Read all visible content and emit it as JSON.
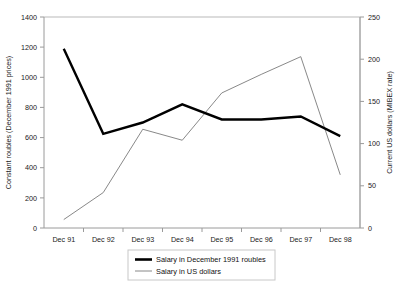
{
  "chart_data": {
    "type": "line",
    "title": "",
    "xlabel": "",
    "ylabel": "Constant roubles (December 1991 prices)",
    "y2label": "Current US dollars (MIBEX rate)",
    "categories": [
      "Dec 91",
      "Dec 92",
      "Dec 93",
      "Dec 94",
      "Dec 95",
      "Dec 96",
      "Dec 97",
      "Dec 98"
    ],
    "ylim": [
      0,
      1400
    ],
    "y2lim": [
      0,
      250
    ],
    "yticks": [
      0,
      200,
      400,
      600,
      800,
      1000,
      1200,
      1400
    ],
    "y2ticks": [
      0,
      50,
      100,
      150,
      200,
      250
    ],
    "grid": false,
    "legend_position": "bottom",
    "series": [
      {
        "name": "Salary in December 1991 roubles",
        "axis": "left",
        "color": "#000000",
        "style": "thick",
        "values": [
          1190,
          625,
          700,
          820,
          720,
          720,
          740,
          610
        ]
      },
      {
        "name": "Salary in US dollars",
        "axis": "right",
        "color": "#7a7a7a",
        "style": "thin",
        "values": [
          10,
          42,
          117,
          104,
          160,
          182,
          203,
          63
        ]
      }
    ]
  },
  "axes": {
    "left": {
      "title": "Constant roubles (December 1991 prices)",
      "tick_labels": [
        "0",
        "200",
        "400",
        "600",
        "800",
        "1000",
        "1200",
        "1400"
      ]
    },
    "right": {
      "title": "Current US dollars (MIBEX rate)",
      "tick_labels": [
        "0",
        "50",
        "100",
        "150",
        "200",
        "250"
      ]
    },
    "bottom": {
      "tick_labels": [
        "Dec 91",
        "Dec 92",
        "Dec 93",
        "Dec 94",
        "Dec 95",
        "Dec 96",
        "Dec 97",
        "Dec 98"
      ]
    }
  },
  "legend": {
    "items": [
      {
        "label": "Salary in December 1991 roubles",
        "style": "thick"
      },
      {
        "label": "Salary in US dollars",
        "style": "thin"
      }
    ]
  },
  "colors": {
    "series_roubles": "#000000",
    "series_dollars": "#7a7a7a",
    "axis": "#9a9a9a",
    "plot_border": "#b9b9b9",
    "background": "#ffffff"
  }
}
